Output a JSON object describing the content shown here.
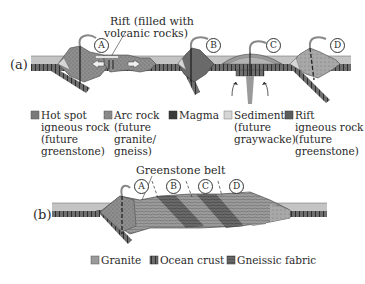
{
  "panel_a": {
    "label": "(a)",
    "rift_note": "Rift (filled with\nvolcanic rocks)",
    "rift_note_line1": "Rift (filled with",
    "rift_note_line2": "volcanic rocks)",
    "markers": [
      "A",
      "B",
      "C",
      "D"
    ]
  },
  "legend_a": [
    {
      "name": "hot-spot",
      "lines": [
        "Hot spot",
        "igneous rock",
        "(future",
        "greenstone)"
      ],
      "color": "#7a7a7a"
    },
    {
      "name": "arc-rock",
      "lines": [
        "Arc rock",
        "(future",
        "granite/",
        "gneiss)"
      ],
      "color": "#8c8c8c"
    },
    {
      "name": "magma",
      "lines": [
        "Magma"
      ],
      "color": "#3a3a3a"
    },
    {
      "name": "sediment",
      "lines": [
        "Sediment",
        "(future",
        "graywacke)"
      ],
      "color": "#d6d6d6"
    },
    {
      "name": "rift",
      "lines": [
        "Rift",
        "igneous rock",
        "(future",
        "greenstone)"
      ],
      "color": "#5c5c5c"
    }
  ],
  "panel_b": {
    "label": "(b)",
    "belt_note": "Greenstone belt",
    "markers": [
      "A",
      "B",
      "C",
      "D"
    ]
  },
  "legend_b": [
    {
      "name": "granite",
      "label": "Granite",
      "color": "#9a9a9a"
    },
    {
      "name": "ocean-crust",
      "label": "Ocean crust",
      "color": "#6a6a6a"
    },
    {
      "name": "gneissic-fabric",
      "label": "Gneissic fabric",
      "color": "#4a4a4a"
    }
  ],
  "colors": {
    "ocean": "#c4c4c4",
    "crust": "#707070",
    "rock": "#8e8e8e",
    "dark": "#3a3a3a"
  }
}
